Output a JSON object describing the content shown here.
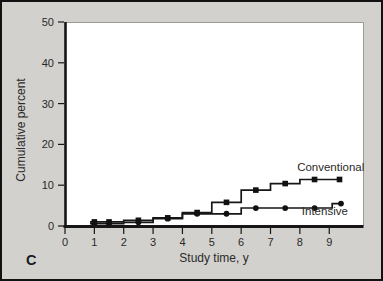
{
  "panel": {
    "label": "C"
  },
  "colors": {
    "figure_background": "#d3d1cd",
    "figure_border": "#121212",
    "plot_background": "#ffffff",
    "plot_border": "#9b9a96",
    "line": "#161616",
    "marker": "#111111",
    "text": "#2a2a2a"
  },
  "chart_data": {
    "type": "line",
    "subtype": "step",
    "title": "",
    "xlabel": "Study time, y",
    "ylabel": "Cumulative percent",
    "xlim": [
      0,
      10.15
    ],
    "ylim": [
      0,
      50
    ],
    "x_ticks": [
      0,
      1,
      2,
      3,
      4,
      5,
      6,
      7,
      8,
      9
    ],
    "y_ticks": [
      0,
      10,
      20,
      30,
      40,
      50
    ],
    "grid": false,
    "legend_position": "inline-annotations",
    "series": [
      {
        "name": "Conventional",
        "marker": "square",
        "step_path": [
          [
            0.85,
            1.0
          ],
          [
            2,
            1.0
          ],
          [
            2,
            1.4
          ],
          [
            3,
            1.4
          ],
          [
            3,
            2.0
          ],
          [
            4,
            2.0
          ],
          [
            4,
            3.3
          ],
          [
            5,
            3.3
          ],
          [
            5,
            5.8
          ],
          [
            6,
            5.8
          ],
          [
            6,
            8.8
          ],
          [
            7,
            8.8
          ],
          [
            7,
            10.4
          ],
          [
            8,
            10.4
          ],
          [
            8,
            11.4
          ],
          [
            9.4,
            11.4
          ]
        ],
        "markers": [
          [
            1,
            1.0
          ],
          [
            1.5,
            1.0
          ],
          [
            2.5,
            1.4
          ],
          [
            3.5,
            2.0
          ],
          [
            4.5,
            3.3
          ],
          [
            5.5,
            5.8
          ],
          [
            6.5,
            8.8
          ],
          [
            7.5,
            10.4
          ],
          [
            8.5,
            11.4
          ],
          [
            9.35,
            11.4
          ]
        ],
        "label": {
          "text": "Conventional",
          "x": 9.05,
          "y": 13.5
        }
      },
      {
        "name": "Intensive",
        "marker": "circle",
        "step_path": [
          [
            0.85,
            0.6
          ],
          [
            2,
            0.6
          ],
          [
            2,
            0.9
          ],
          [
            3,
            0.9
          ],
          [
            3,
            1.8
          ],
          [
            4,
            1.8
          ],
          [
            4,
            3.0
          ],
          [
            6,
            3.0
          ],
          [
            6,
            4.4
          ],
          [
            9.1,
            4.4
          ],
          [
            9.1,
            5.5
          ],
          [
            9.45,
            5.5
          ]
        ],
        "markers": [
          [
            1,
            0.6
          ],
          [
            1.5,
            0.6
          ],
          [
            2.5,
            0.9
          ],
          [
            3.5,
            1.8
          ],
          [
            4.5,
            3.0
          ],
          [
            5.5,
            3.0
          ],
          [
            6.5,
            4.4
          ],
          [
            7.5,
            4.4
          ],
          [
            8.5,
            4.4
          ],
          [
            9.4,
            5.5
          ]
        ],
        "label": {
          "text": "Intensive",
          "x": 8.85,
          "y": 2.6
        }
      }
    ]
  }
}
